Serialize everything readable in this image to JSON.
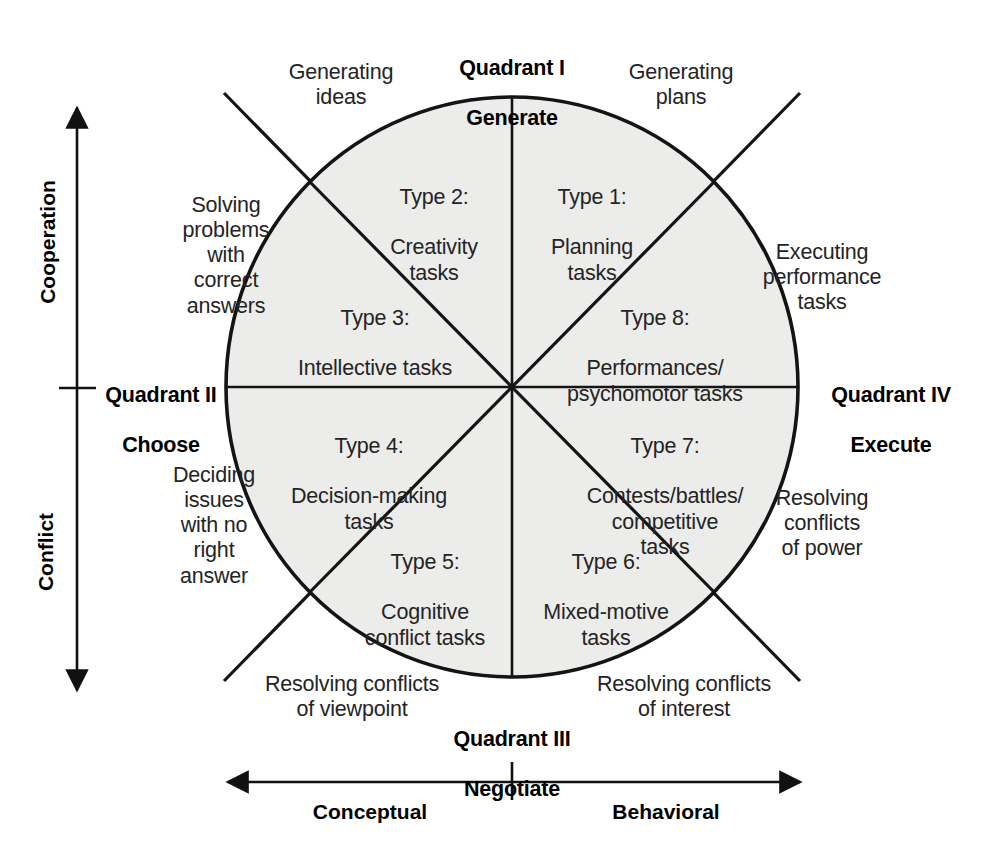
{
  "figure": {
    "circle_fill": "#ececeb",
    "line_color": "#141414",
    "text_color": "#242424"
  },
  "axes": {
    "vertical": {
      "top_label": "Cooperation",
      "bottom_label": "Conflict"
    },
    "horizontal": {
      "left_label": "Conceptual",
      "right_label": "Behavioral"
    }
  },
  "quadrants": [
    {
      "id": "I",
      "name": "Quadrant I",
      "verb": "Generate",
      "position": "top"
    },
    {
      "id": "II",
      "name": "Quadrant II",
      "verb": "Choose",
      "position": "left"
    },
    {
      "id": "III",
      "name": "Quadrant III",
      "verb": "Negotiate",
      "position": "bottom"
    },
    {
      "id": "IV",
      "name": "Quadrant IV",
      "verb": "Execute",
      "position": "right"
    }
  ],
  "segments": [
    {
      "type": "Type 1:",
      "name": "Planning\ntasks",
      "position": "top-right-inner"
    },
    {
      "type": "Type 2:",
      "name": "Creativity\ntasks",
      "position": "top-left-inner"
    },
    {
      "type": "Type 3:",
      "name": "Intellective tasks",
      "position": "upper-left"
    },
    {
      "type": "Type 4:",
      "name": "Decision-making\ntasks",
      "position": "lower-left"
    },
    {
      "type": "Type 5:",
      "name": "Cognitive\nconflict tasks",
      "position": "bottom-left-inner"
    },
    {
      "type": "Type 6:",
      "name": "Mixed-motive\ntasks",
      "position": "bottom-right-inner"
    },
    {
      "type": "Type 7:",
      "name": "Contests/battles/\ncompetitive\ntasks",
      "position": "lower-right"
    },
    {
      "type": "Type 8:",
      "name": "Performances/\npsychomotor tasks",
      "position": "upper-right"
    }
  ],
  "outer_labels": [
    {
      "id": "generating-ideas",
      "text": "Generating\nideas"
    },
    {
      "id": "generating-plans",
      "text": "Generating\nplans"
    },
    {
      "id": "solving-problems",
      "text": "Solving\nproblems\nwith\ncorrect\nanswers"
    },
    {
      "id": "executing-performance",
      "text": "Executing\nperformance\ntasks"
    },
    {
      "id": "deciding-issues",
      "text": "Deciding\nissues\nwith no\nright\nanswer"
    },
    {
      "id": "resolving-power",
      "text": "Resolving\nconflicts\nof power"
    },
    {
      "id": "resolving-viewpoint",
      "text": "Resolving conflicts\nof viewpoint"
    },
    {
      "id": "resolving-interest",
      "text": "Resolving conflicts\nof interest"
    }
  ]
}
